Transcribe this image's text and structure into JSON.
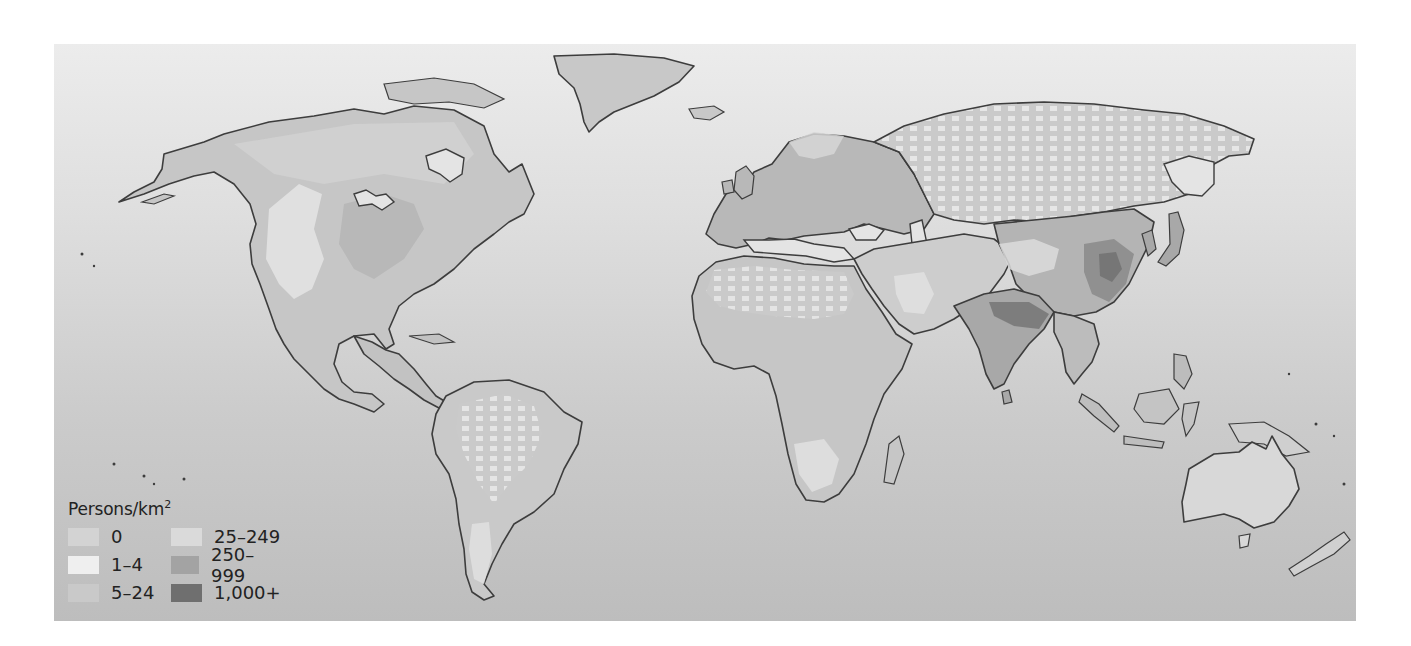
{
  "map": {
    "type": "choropleth",
    "subject": "World population density",
    "projection": "equirectangular-like world map",
    "colors": {
      "background_top": "#ececec",
      "background_bottom": "#bdbdbd",
      "coastline": "#3d3d3d"
    }
  },
  "legend": {
    "title": "Persons/km",
    "title_superscript": "2",
    "items": [
      {
        "label": "0",
        "color": "#d3d3d3"
      },
      {
        "label": "1–4",
        "color": "#efefef"
      },
      {
        "label": "5–24",
        "color": "#c9c9c9"
      },
      {
        "label": "25–249",
        "color": "#dadada"
      },
      {
        "label": "250–999",
        "color": "#a3a3a3"
      },
      {
        "label": "1,000+",
        "color": "#6f6f6f"
      }
    ]
  },
  "regions": [
    {
      "name": "North America",
      "dominant_class": "5–24",
      "notes": "Eastern US 25–249; interior West and northern Canada sparser"
    },
    {
      "name": "Greenland",
      "dominant_class": "0"
    },
    {
      "name": "South America",
      "dominant_class": "1–4",
      "notes": "Coastal areas 5–24 / 25–249"
    },
    {
      "name": "Europe",
      "dominant_class": "25–249"
    },
    {
      "name": "Africa",
      "dominant_class": "5–24",
      "notes": "Sahara 0 / 1–4"
    },
    {
      "name": "Russia / Central Asia",
      "dominant_class": "1–4"
    },
    {
      "name": "South Asia",
      "dominant_class": "250–999",
      "notes": "Ganges plain reaches 1,000+"
    },
    {
      "name": "East China",
      "dominant_class": "250–999",
      "notes": "pockets of 1,000+"
    },
    {
      "name": "Australia",
      "dominant_class": "1–4"
    },
    {
      "name": "New Zealand",
      "dominant_class": "5–24"
    }
  ]
}
